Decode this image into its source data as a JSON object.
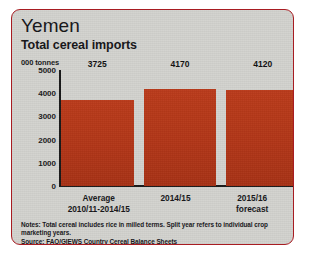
{
  "card": {
    "title": "Yemen",
    "subtitle": "Total cereal imports",
    "border_color": "#a81c22",
    "background_color": "#d3d3cf"
  },
  "notes": {
    "note_line": "Notes: Total cereal includes rice in milled terms. Split year refers to individual crop marketing years.",
    "source_line": "Source: FAO/GIEWS Country Cereal Balance Sheets"
  },
  "chart_data": {
    "type": "bar",
    "title": "Total cereal imports",
    "subtitle": "Yemen",
    "categories": [
      "Average\n2010/11-2014/15",
      "2014/15",
      "2015/16\nforecast"
    ],
    "values": [
      3725,
      4170,
      4120
    ],
    "data_labels": [
      "3725",
      "4170",
      "4120"
    ],
    "xlabel": "",
    "ylabel": "000 tonnes",
    "ylim": [
      0,
      5000
    ],
    "yticks": [
      5000,
      4000,
      3000,
      2000,
      1000,
      0
    ],
    "ytick_labels": [
      "5000",
      "4000",
      "3000",
      "2000",
      "1000",
      "0"
    ],
    "grid": false,
    "legend": false,
    "bar_color": "#b8391a"
  }
}
